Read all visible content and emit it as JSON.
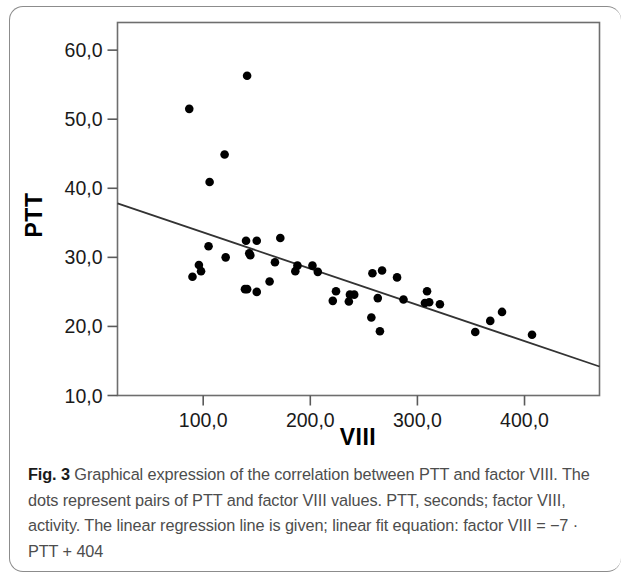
{
  "figure": {
    "label": "Fig. 3",
    "caption": " Graphical expression of the correlation between PTT and factor VIII. The dots represent pairs of PTT and factor VIII values. PTT, seconds; factor VIII, activity. The linear regression line is given; linear fit equation: factor VIII = −7 · PTT + 404"
  },
  "chart_data": {
    "type": "scatter",
    "title": "",
    "xlabel": "VIII",
    "ylabel": "PTT",
    "xlim": [
      20,
      470
    ],
    "ylim": [
      10.0,
      64.0
    ],
    "xticks": [
      100,
      200,
      300,
      400
    ],
    "xtick_labels": [
      "100,0",
      "200,0",
      "300,0",
      "400,0"
    ],
    "yticks": [
      10.0,
      20.0,
      30.0,
      40.0,
      50.0,
      60.0
    ],
    "ytick_labels": [
      "10,0",
      "20,0",
      "30,0",
      "40,0",
      "50,0",
      "60,0"
    ],
    "grid": false,
    "legend": false,
    "marker_color": "#000000",
    "line_color": "#333333",
    "point_label": "VIII vs PTT observation",
    "points": [
      {
        "x": 87,
        "y": 51.5
      },
      {
        "x": 141,
        "y": 56.3
      },
      {
        "x": 120,
        "y": 44.9
      },
      {
        "x": 106,
        "y": 40.9
      },
      {
        "x": 172,
        "y": 32.8
      },
      {
        "x": 140,
        "y": 32.4
      },
      {
        "x": 150,
        "y": 32.4
      },
      {
        "x": 105,
        "y": 31.6
      },
      {
        "x": 143,
        "y": 30.6
      },
      {
        "x": 144,
        "y": 30.3
      },
      {
        "x": 121,
        "y": 30.0
      },
      {
        "x": 167,
        "y": 29.3
      },
      {
        "x": 96,
        "y": 28.9
      },
      {
        "x": 188,
        "y": 28.8
      },
      {
        "x": 202,
        "y": 28.8
      },
      {
        "x": 98,
        "y": 28.0
      },
      {
        "x": 186,
        "y": 28.0
      },
      {
        "x": 207,
        "y": 27.9
      },
      {
        "x": 258,
        "y": 27.7
      },
      {
        "x": 267,
        "y": 28.1
      },
      {
        "x": 281,
        "y": 27.1
      },
      {
        "x": 90,
        "y": 27.2
      },
      {
        "x": 162,
        "y": 26.5
      },
      {
        "x": 139,
        "y": 25.4
      },
      {
        "x": 141,
        "y": 25.4
      },
      {
        "x": 150,
        "y": 25.0
      },
      {
        "x": 224,
        "y": 25.1
      },
      {
        "x": 309,
        "y": 25.1
      },
      {
        "x": 237,
        "y": 24.6
      },
      {
        "x": 241,
        "y": 24.6
      },
      {
        "x": 263,
        "y": 24.1
      },
      {
        "x": 287,
        "y": 23.9
      },
      {
        "x": 221,
        "y": 23.7
      },
      {
        "x": 236,
        "y": 23.6
      },
      {
        "x": 307,
        "y": 23.4
      },
      {
        "x": 311,
        "y": 23.5
      },
      {
        "x": 321,
        "y": 23.2
      },
      {
        "x": 379,
        "y": 22.1
      },
      {
        "x": 257,
        "y": 21.3
      },
      {
        "x": 368,
        "y": 20.8
      },
      {
        "x": 265,
        "y": 19.3
      },
      {
        "x": 354,
        "y": 19.2
      },
      {
        "x": 407,
        "y": 18.8
      }
    ],
    "regression_line": {
      "label": "linear regression line",
      "equation": "factor VIII = −7 · PTT + 404",
      "x_start": 20,
      "y_start": 37.8,
      "x_end": 470,
      "y_end": 14.2
    }
  }
}
